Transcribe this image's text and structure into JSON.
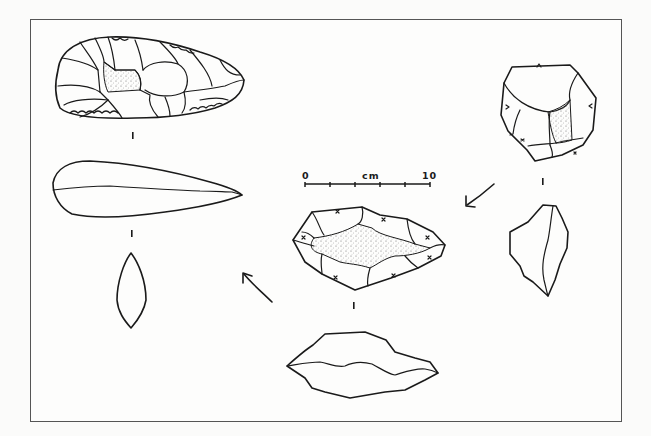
{
  "figure": {
    "title": "",
    "colors": {
      "ink": "#1a1a1a",
      "frame": "#555555",
      "background": "#fbfbfa",
      "stipple": "#8a8a8a"
    }
  },
  "scale_bar": {
    "start_label": "0",
    "unit_label": "cm",
    "end_label": "10",
    "ticks": 6
  },
  "artifacts": [
    {
      "id": "artifact-core",
      "stage": 1,
      "views": [
        "face",
        "profile"
      ],
      "position": "right"
    },
    {
      "id": "artifact-roughout",
      "stage": 2,
      "views": [
        "face",
        "profile"
      ],
      "position": "center"
    },
    {
      "id": "artifact-handaxe",
      "stage": 3,
      "views": [
        "face",
        "profile",
        "section"
      ],
      "position": "left"
    }
  ],
  "arrows": [
    {
      "id": "arrow-core-to-roughout",
      "direction": "down-left"
    },
    {
      "id": "arrow-roughout-to-handaxe",
      "direction": "up-left"
    }
  ]
}
